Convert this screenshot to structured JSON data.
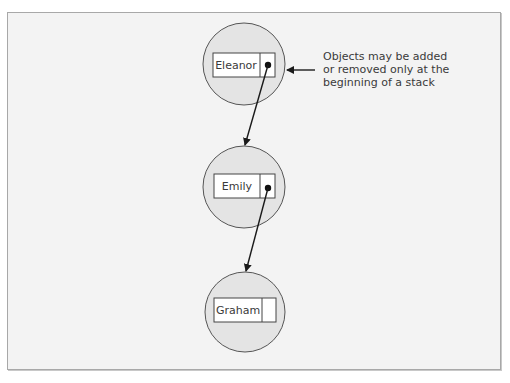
{
  "diagram": {
    "nodes": [
      {
        "label": "Eleanor",
        "cx": 244,
        "cy": 64,
        "r": 41,
        "box": {
          "x": 213,
          "y": 53,
          "w": 62,
          "h": 24,
          "divider": 260
        },
        "pointer": true,
        "dot": {
          "x": 268,
          "y": 65
        }
      },
      {
        "label": "Emily",
        "cx": 244,
        "cy": 187,
        "r": 41,
        "box": {
          "x": 214,
          "y": 174,
          "w": 61,
          "h": 24,
          "divider": 260
        },
        "pointer": true,
        "dot": {
          "x": 268,
          "y": 188
        }
      },
      {
        "label": "Graham",
        "cx": 245,
        "cy": 312,
        "r": 40,
        "box": {
          "x": 214,
          "y": 298,
          "w": 62,
          "h": 24,
          "divider": 262
        },
        "pointer": false
      }
    ],
    "edges": [
      {
        "from": "Eleanor",
        "to": "Emily",
        "x1": 268,
        "y1": 65,
        "x2": 245,
        "y2": 145
      },
      {
        "from": "Emily",
        "to": "Graham",
        "x1": 268,
        "y1": 188,
        "x2": 246,
        "y2": 271
      }
    ],
    "callout": {
      "lines": [
        "Objects may be added",
        "or removed only at the",
        "beginning of a stack"
      ],
      "arrow": {
        "x1": 315,
        "y1": 70,
        "x2": 287,
        "y2": 70
      }
    },
    "colors": {
      "frame_bg": "#f3f3f3",
      "frame_border": "#a8a8a8",
      "circle_fill": "#e4e4e4",
      "circle_stroke": "#555555",
      "box_fill": "#ffffff",
      "line": "#1a1a1a"
    }
  }
}
